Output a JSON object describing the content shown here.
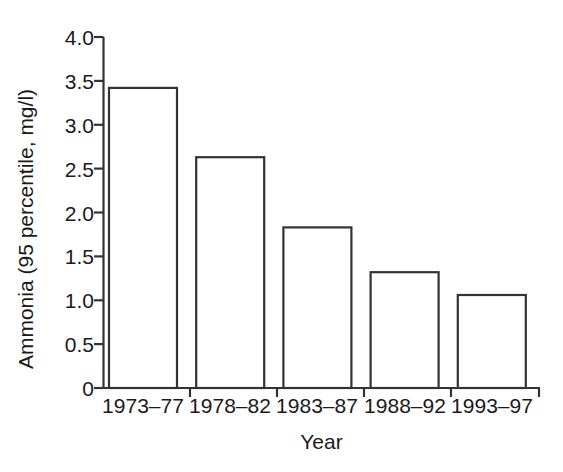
{
  "chart_data": {
    "type": "bar",
    "title": "",
    "subtitle": "",
    "xlabel": "Year",
    "ylabel": "Ammonia (95 percentile, mg/l)",
    "categories": [
      "1973–77",
      "1978–82",
      "1983–87",
      "1988–92",
      "1993–97"
    ],
    "values": [
      3.42,
      2.63,
      1.83,
      1.32,
      1.06
    ],
    "series": [
      {
        "name": "Ammonia (95 percentile, mg/l)",
        "values": [
          3.42,
          2.63,
          1.83,
          1.32,
          1.06
        ]
      }
    ],
    "ylim": [
      0,
      4.0
    ],
    "ytick_labels": [
      "4.0",
      "3.5",
      "3.0",
      "2.5",
      "2.0",
      "1.5",
      "1.0",
      "0.5",
      "0"
    ],
    "ytick_values": [
      4.0,
      3.5,
      3.0,
      2.5,
      2.0,
      1.5,
      1.0,
      0.5,
      0
    ],
    "grid": false,
    "legend": false,
    "legend_position": "none",
    "bar_fill_color": "#ffffff",
    "bar_edge_color": "#333333",
    "axis_color": "#333333",
    "background_color": "#ffffff"
  },
  "axes": {
    "y_title": "Ammonia (95 percentile, mg/l)",
    "x_title": "Year"
  }
}
